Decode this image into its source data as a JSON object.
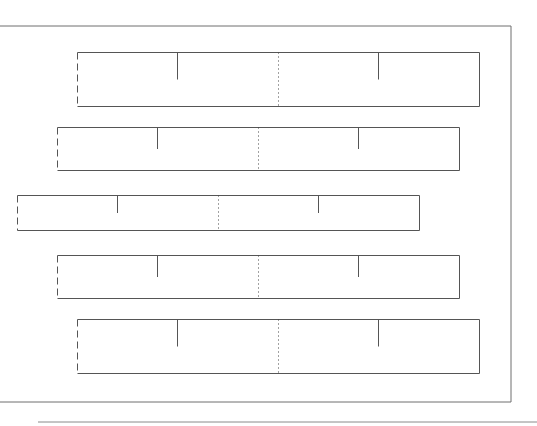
{
  "chart_data": {
    "type": "boxplot",
    "title": "",
    "xlabel": "",
    "ylabel": "",
    "xlim": [
      0,
      537
    ],
    "grid": false,
    "legend": "none",
    "series": [
      {
        "name": "row-1",
        "left": 77,
        "q1": 177,
        "median": 278,
        "q3": 378,
        "right": 479
      },
      {
        "name": "row-2",
        "left": 57,
        "q1": 157,
        "median": 258,
        "q3": 358,
        "right": 459
      },
      {
        "name": "row-3",
        "left": 17,
        "q1": 117,
        "median": 218,
        "q3": 318,
        "right": 419
      },
      {
        "name": "row-4",
        "left": 57,
        "q1": 157,
        "median": 258,
        "q3": 358,
        "right": 459
      },
      {
        "name": "row-5",
        "left": 77,
        "q1": 177,
        "median": 278,
        "q3": 378,
        "right": 479
      }
    ],
    "colors": {
      "frame": "#6e6e6e",
      "box": "#555555",
      "median": "#444444",
      "rule": "#8a8a8a"
    }
  }
}
